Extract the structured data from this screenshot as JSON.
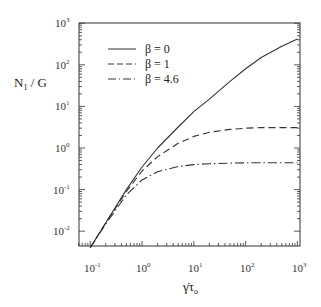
{
  "chart_data": {
    "type": "line",
    "title": "",
    "xlabel": "γ̇τo",
    "ylabel": "N1 / G",
    "xscale": "log",
    "yscale": "log",
    "xlim": [
      0.06,
      1000
    ],
    "ylim": [
      0.0044,
      1000
    ],
    "grid": false,
    "legend_position": "upper left (inside)",
    "x_ticks": [
      "10-1",
      "100",
      "101",
      "102",
      "103"
    ],
    "y_ticks": [
      "10-2",
      "10-1",
      "100",
      "101",
      "102",
      "103"
    ],
    "x": [
      0.1,
      0.2,
      0.5,
      1,
      2,
      5,
      10,
      20,
      50,
      100,
      200,
      500,
      1000
    ],
    "series": [
      {
        "name": "β = 0",
        "style": "solid",
        "values": [
          0.004,
          0.016,
          0.1,
          0.35,
          1.0,
          3.2,
          7.5,
          15,
          40,
          80,
          150,
          280,
          420
        ]
      },
      {
        "name": "β = 1",
        "style": "dashed",
        "values": [
          0.004,
          0.016,
          0.09,
          0.28,
          0.62,
          1.3,
          1.9,
          2.4,
          2.8,
          3.0,
          3.1,
          3.1,
          3.1
        ]
      },
      {
        "name": "β = 4.6",
        "style": "dash-dot",
        "values": [
          0.004,
          0.015,
          0.075,
          0.17,
          0.27,
          0.36,
          0.4,
          0.42,
          0.43,
          0.44,
          0.44,
          0.44,
          0.44
        ]
      }
    ]
  },
  "labels": {
    "y_axis": "N",
    "y_axis_sub": "1",
    "y_axis_rest": " / G",
    "x_axis_gamma": "γ̇",
    "x_axis_tau": "τ",
    "x_axis_sub": "o"
  },
  "legend": [
    {
      "label": "β = 0"
    },
    {
      "label": "β = 1"
    },
    {
      "label": "β = 4.6"
    }
  ],
  "x_tick_labels": [
    {
      "base": "10",
      "exp": "-1"
    },
    {
      "base": "10",
      "exp": "0"
    },
    {
      "base": "10",
      "exp": "1"
    },
    {
      "base": "10",
      "exp": "2"
    },
    {
      "base": "10",
      "exp": "3"
    }
  ],
  "y_tick_labels": [
    {
      "base": "10",
      "exp": "3"
    },
    {
      "base": "10",
      "exp": "2"
    },
    {
      "base": "10",
      "exp": "1"
    },
    {
      "base": "10",
      "exp": "0"
    },
    {
      "base": "10",
      "exp": "-1"
    },
    {
      "base": "10",
      "exp": "-2"
    }
  ]
}
